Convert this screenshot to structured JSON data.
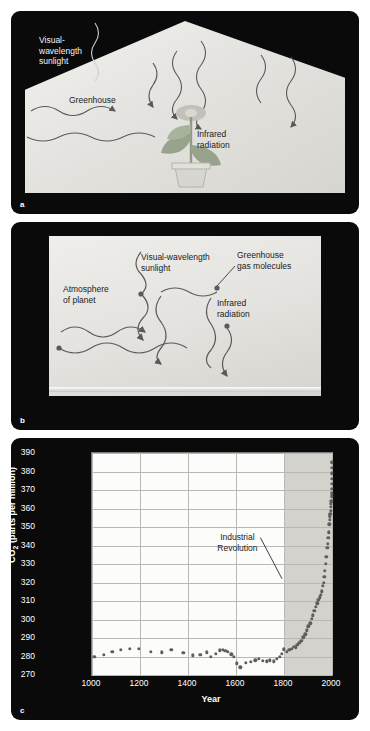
{
  "panels": {
    "a": {
      "letter": "a",
      "labels": {
        "visual_sunlight": "Visual-\nwavelength\nsunlight",
        "greenhouse": "Greenhouse",
        "infrared": "Infrared\nradiation"
      }
    },
    "b": {
      "letter": "b",
      "labels": {
        "atmosphere": "Atmosphere\nof planet",
        "visual_sunlight": "Visual-wavelength\nsunlight",
        "gas_molecules": "Greenhouse\ngas molecules",
        "infrared": "Infrared\nradiation"
      }
    },
    "c": {
      "letter": "c"
    }
  },
  "chart_data": {
    "type": "scatter",
    "title": "",
    "xlabel": "Year",
    "ylabel": "CO₂ (parts per million)",
    "xlim": [
      1000,
      2000
    ],
    "ylim": [
      270,
      390
    ],
    "xticks": [
      1000,
      1200,
      1400,
      1600,
      1800,
      2000
    ],
    "yticks": [
      270,
      280,
      290,
      300,
      310,
      320,
      330,
      340,
      350,
      360,
      370,
      380,
      390
    ],
    "grid": true,
    "legend": "none",
    "annotations": [
      {
        "text": "Industrial\nRevolution",
        "x": 1610,
        "y": 341,
        "points_to_x": 1800,
        "points_to_y": 322
      }
    ],
    "shaded_region": {
      "from_x": 1800,
      "to_x": 2000,
      "color": "#d3d2cd",
      "label": "industrial era"
    },
    "points": [
      {
        "x": 1010,
        "y": 280.0
      },
      {
        "x": 1048,
        "y": 281.0
      },
      {
        "x": 1085,
        "y": 282.4
      },
      {
        "x": 1120,
        "y": 283.6
      },
      {
        "x": 1158,
        "y": 284.1
      },
      {
        "x": 1196,
        "y": 284.2
      },
      {
        "x": 1245,
        "y": 282.6
      },
      {
        "x": 1290,
        "y": 282.2
      },
      {
        "x": 1330,
        "y": 283.6
      },
      {
        "x": 1380,
        "y": 282.0
      },
      {
        "x": 1420,
        "y": 280.7
      },
      {
        "x": 1452,
        "y": 281.0
      },
      {
        "x": 1478,
        "y": 282.3
      },
      {
        "x": 1495,
        "y": 279.9
      },
      {
        "x": 1515,
        "y": 281.6
      },
      {
        "x": 1532,
        "y": 283.4
      },
      {
        "x": 1545,
        "y": 283.6
      },
      {
        "x": 1556,
        "y": 283.2
      },
      {
        "x": 1566,
        "y": 282.6
      },
      {
        "x": 1580,
        "y": 281.2
      },
      {
        "x": 1592,
        "y": 279.7
      },
      {
        "x": 1604,
        "y": 276.4
      },
      {
        "x": 1618,
        "y": 274.2
      },
      {
        "x": 1640,
        "y": 276.6
      },
      {
        "x": 1662,
        "y": 277.2
      },
      {
        "x": 1680,
        "y": 277.9
      },
      {
        "x": 1695,
        "y": 278.6
      },
      {
        "x": 1712,
        "y": 277.6
      },
      {
        "x": 1728,
        "y": 277.3
      },
      {
        "x": 1742,
        "y": 277.9
      },
      {
        "x": 1758,
        "y": 277.4
      },
      {
        "x": 1770,
        "y": 278.9
      },
      {
        "x": 1782,
        "y": 280.0
      },
      {
        "x": 1792,
        "y": 281.4
      },
      {
        "x": 1800,
        "y": 283.8
      },
      {
        "x": 1812,
        "y": 282.4
      },
      {
        "x": 1822,
        "y": 283.6
      },
      {
        "x": 1832,
        "y": 284.0
      },
      {
        "x": 1840,
        "y": 285.4
      },
      {
        "x": 1848,
        "y": 285.0
      },
      {
        "x": 1856,
        "y": 286.2
      },
      {
        "x": 1864,
        "y": 287.4
      },
      {
        "x": 1872,
        "y": 288.6
      },
      {
        "x": 1880,
        "y": 290.3
      },
      {
        "x": 1888,
        "y": 292.0
      },
      {
        "x": 1895,
        "y": 294.2
      },
      {
        "x": 1902,
        "y": 296.4
      },
      {
        "x": 1909,
        "y": 298.0
      },
      {
        "x": 1915,
        "y": 300.4
      },
      {
        "x": 1921,
        "y": 302.2
      },
      {
        "x": 1927,
        "y": 304.6
      },
      {
        "x": 1933,
        "y": 306.8
      },
      {
        "x": 1938,
        "y": 308.8
      },
      {
        "x": 1943,
        "y": 310.6
      },
      {
        "x": 1948,
        "y": 312.0
      },
      {
        "x": 1953,
        "y": 313.4
      },
      {
        "x": 1958,
        "y": 315.3
      },
      {
        "x": 1962,
        "y": 318.2
      },
      {
        "x": 1965,
        "y": 320.0
      },
      {
        "x": 1968,
        "y": 323.0
      },
      {
        "x": 1971,
        "y": 326.2
      },
      {
        "x": 1974,
        "y": 330.0
      },
      {
        "x": 1977,
        "y": 333.8
      },
      {
        "x": 1980,
        "y": 338.6
      },
      {
        "x": 1982,
        "y": 341.0
      },
      {
        "x": 1984,
        "y": 344.2
      },
      {
        "x": 1986,
        "y": 347.2
      },
      {
        "x": 1988,
        "y": 351.4
      },
      {
        "x": 1990,
        "y": 354.0
      },
      {
        "x": 1991,
        "y": 355.6
      },
      {
        "x": 1992,
        "y": 356.4
      },
      {
        "x": 1993,
        "y": 357.0
      },
      {
        "x": 1994,
        "y": 358.8
      },
      {
        "x": 1995,
        "y": 360.8
      },
      {
        "x": 1996,
        "y": 362.6
      },
      {
        "x": 1997,
        "y": 363.8
      },
      {
        "x": 1998,
        "y": 366.6
      },
      {
        "x": 1999,
        "y": 368.3
      },
      {
        "x": 1999.4,
        "y": 370.5
      },
      {
        "x": 1999.6,
        "y": 373.2
      },
      {
        "x": 1999.8,
        "y": 376.0
      },
      {
        "x": 1999.9,
        "y": 379.0
      },
      {
        "x": 2000,
        "y": 382.0
      },
      {
        "x": 2000,
        "y": 385.0
      }
    ]
  }
}
